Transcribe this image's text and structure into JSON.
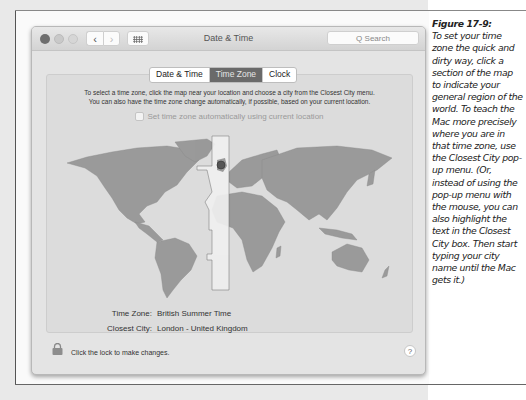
{
  "window": {
    "title": "Date & Time",
    "nav_back": "‹",
    "nav_forward": "›",
    "search_placeholder": "Q  Search"
  },
  "tabs": [
    {
      "label": "Date & Time",
      "active": false
    },
    {
      "label": "Time Zone",
      "active": true
    },
    {
      "label": "Clock",
      "active": false
    }
  ],
  "time_zone_pane": {
    "instructions_line1": "To select a time zone, click the map near your location and choose a city from the Closest City menu.",
    "instructions_line2": "You can also have the time zone change automatically, if possible, based on your current location.",
    "auto_checkbox_label": "Set time zone automatically using current location",
    "auto_checked": false,
    "time_zone_label": "Time Zone:",
    "time_zone_value": "British Summer Time",
    "closest_city_label": "Closest City:",
    "closest_city_value": "London - United Kingdom"
  },
  "footer": {
    "lock_text": "Click the lock to make changes.",
    "help_label": "?"
  },
  "caption": {
    "figure_label": "Figure 17-9:",
    "text": "To set your time zone the quick and dirty way, click a section of the map to indicate your general region of the world. To teach the Mac more precisely where you are in that time zone, use the Closest City pop-up menu. (Or, instead of using the pop-up menu with the mouse, you can also highlight the text in the Closest City box. Then start typing your city name until the Mac gets it.)"
  },
  "colors": {
    "land": "#9a9a9a",
    "selected_zone": "#efefef",
    "active_tab": "#6a6a6a",
    "location_dot": "#555555"
  }
}
